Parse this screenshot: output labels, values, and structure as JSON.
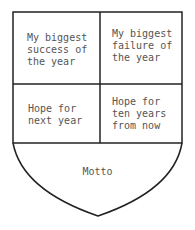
{
  "shield": {
    "cells": [
      {
        "label": "My biggest\nsuccess of\nthe year"
      },
      {
        "label": "My biggest\nfailure of\nthe year"
      },
      {
        "label": "Hope for\nnext year"
      },
      {
        "label": "Hope for\nten years\nfrom now"
      }
    ],
    "motto": "Motto",
    "stroke_color": "#222222",
    "text_color": "#555555"
  }
}
